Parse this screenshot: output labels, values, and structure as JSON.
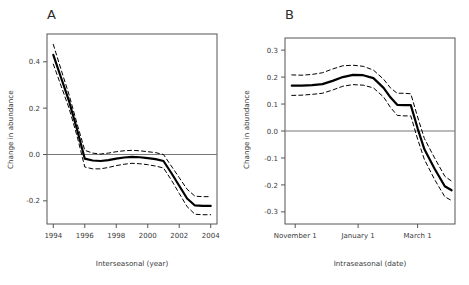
{
  "figure": {
    "background": "#ffffff",
    "line_color": "#000000",
    "ci_color": "#000000",
    "zero_line_color": "#777777",
    "axis_color": "#555555"
  },
  "chart_data": [
    {
      "id": "panel-a",
      "type": "line",
      "panel_letter": "A",
      "title": "",
      "xlabel": "Interseasonal (year)",
      "ylabel": "Change in abundance",
      "xlim": [
        1993.6,
        2004.4
      ],
      "ylim": [
        -0.3,
        0.52
      ],
      "grid": false,
      "legend": "none",
      "xticks": [
        1994,
        1996,
        1998,
        2000,
        2002,
        2004
      ],
      "xticklabels": [
        "1994",
        "1996",
        "1998",
        "2000",
        "2002",
        "2004"
      ],
      "yticks": [
        0.4,
        0.2,
        0.0,
        -0.2
      ],
      "yticklabels": [
        "0.4",
        "0.2",
        "0.0",
        "-0.2"
      ],
      "zero_reference_line": 0.0,
      "x": [
        1994,
        1994.5,
        1995,
        1995.5,
        1996,
        1996.5,
        1997,
        1997.5,
        1998,
        1998.5,
        1999,
        1999.5,
        2000,
        2000.5,
        2001,
        2001.5,
        2002,
        2002.5,
        2003,
        2003.5,
        2004
      ],
      "series": [
        {
          "name": "fit",
          "style": "solid",
          "values": [
            0.43,
            0.33,
            0.23,
            0.11,
            -0.018,
            -0.026,
            -0.028,
            -0.024,
            -0.018,
            -0.013,
            -0.01,
            -0.012,
            -0.016,
            -0.02,
            -0.028,
            -0.08,
            -0.135,
            -0.19,
            -0.22,
            -0.222,
            -0.222
          ]
        },
        {
          "name": "upper_confidence_limit",
          "style": "dashed",
          "values": [
            0.475,
            0.365,
            0.258,
            0.135,
            0.018,
            0.006,
            0.002,
            0.006,
            0.012,
            0.016,
            0.018,
            0.016,
            0.012,
            0.008,
            0.0,
            -0.05,
            -0.1,
            -0.15,
            -0.18,
            -0.182,
            -0.182
          ]
        },
        {
          "name": "lower_confidence_limit",
          "style": "dashed",
          "values": [
            0.39,
            0.295,
            0.2,
            0.082,
            -0.054,
            -0.062,
            -0.062,
            -0.056,
            -0.048,
            -0.042,
            -0.038,
            -0.04,
            -0.044,
            -0.05,
            -0.058,
            -0.11,
            -0.168,
            -0.225,
            -0.258,
            -0.26,
            -0.26
          ]
        }
      ]
    },
    {
      "id": "panel-b",
      "type": "line",
      "panel_letter": "B",
      "title": "",
      "xlabel": "Intraseasonal (date)",
      "ylabel": "Change in abundance",
      "xlim": [
        0,
        200
      ],
      "ylim": [
        -0.345,
        0.345
      ],
      "grid": false,
      "legend": "none",
      "xticks": [
        12,
        86,
        156
      ],
      "xticklabels": [
        "November 1",
        "January 1",
        "March 1"
      ],
      "yticks": [
        0.3,
        0.2,
        0.1,
        0.0,
        -0.1,
        -0.2,
        -0.3
      ],
      "yticklabels": [
        "0.3",
        "0.2",
        "0.1",
        "0.0",
        "-0.1",
        "-0.2",
        "-0.3"
      ],
      "zero_reference_line": 0.0,
      "x": [
        8,
        20,
        32,
        44,
        56,
        68,
        80,
        92,
        104,
        116,
        124,
        132,
        140,
        148,
        156,
        164,
        176,
        188,
        196
      ],
      "series": [
        {
          "name": "fit",
          "style": "solid",
          "values": [
            0.168,
            0.168,
            0.17,
            0.174,
            0.186,
            0.2,
            0.208,
            0.207,
            0.196,
            0.16,
            0.125,
            0.097,
            0.096,
            0.096,
            0.01,
            -0.068,
            -0.14,
            -0.205,
            -0.22
          ]
        },
        {
          "name": "upper_confidence_limit",
          "style": "dashed",
          "values": [
            0.208,
            0.207,
            0.21,
            0.216,
            0.23,
            0.242,
            0.244,
            0.24,
            0.226,
            0.192,
            0.16,
            0.14,
            0.14,
            0.138,
            0.052,
            -0.028,
            -0.1,
            -0.168,
            -0.186
          ]
        },
        {
          "name": "lower_confidence_limit",
          "style": "dashed",
          "values": [
            0.132,
            0.133,
            0.136,
            0.14,
            0.152,
            0.166,
            0.172,
            0.17,
            0.16,
            0.126,
            0.088,
            0.058,
            0.056,
            0.056,
            -0.03,
            -0.106,
            -0.18,
            -0.244,
            -0.258
          ]
        }
      ]
    }
  ]
}
